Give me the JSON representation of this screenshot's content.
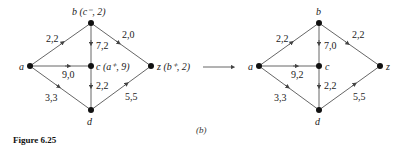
{
  "figure": {
    "caption": "Figure 6.25",
    "sublabel": "(b)"
  },
  "graphs": [
    {
      "id": "left",
      "nodes": {
        "a": {
          "label": "a"
        },
        "b": {
          "label": "b (c⁻, 2)"
        },
        "c": {
          "label": "c (a⁺, 9)"
        },
        "d": {
          "label": "d"
        },
        "z": {
          "label": "z (b⁺, 2)"
        }
      },
      "edges": {
        "ab": "2,2",
        "ac": "9,0",
        "ad": "3,3",
        "bc": "7,2",
        "bz": "2,0",
        "cd": "2,2",
        "dz": "5,5"
      }
    },
    {
      "id": "right",
      "nodes": {
        "a": {
          "label": "a"
        },
        "b": {
          "label": "b"
        },
        "c": {
          "label": "c"
        },
        "d": {
          "label": "d"
        },
        "z": {
          "label": "z"
        }
      },
      "edges": {
        "ab": "2,2",
        "ac": "9,2",
        "ad": "3,3",
        "bc": "7,0",
        "bz": "2,2",
        "cd": "2,2",
        "dz": "5,5"
      }
    }
  ]
}
